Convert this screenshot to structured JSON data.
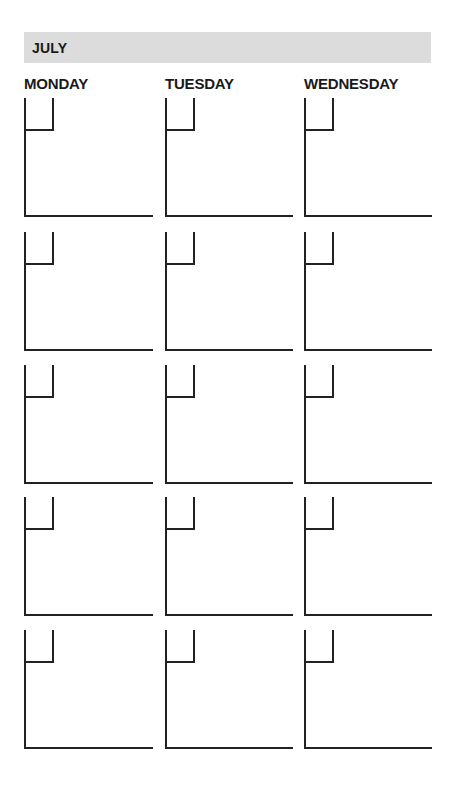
{
  "planner": {
    "month": "JULY",
    "banner_color": "#dcdcdc",
    "line_color": "#222222",
    "days": [
      {
        "label": "MONDAY"
      },
      {
        "label": "TUESDAY"
      },
      {
        "label": "WEDNESDAY"
      }
    ],
    "weeks": [
      {
        "cells": [
          {
            "date": ""
          },
          {
            "date": ""
          },
          {
            "date": ""
          }
        ]
      },
      {
        "cells": [
          {
            "date": ""
          },
          {
            "date": ""
          },
          {
            "date": ""
          }
        ]
      },
      {
        "cells": [
          {
            "date": ""
          },
          {
            "date": ""
          },
          {
            "date": ""
          }
        ]
      },
      {
        "cells": [
          {
            "date": ""
          },
          {
            "date": ""
          },
          {
            "date": ""
          }
        ]
      },
      {
        "cells": [
          {
            "date": ""
          },
          {
            "date": ""
          },
          {
            "date": ""
          }
        ]
      }
    ]
  }
}
